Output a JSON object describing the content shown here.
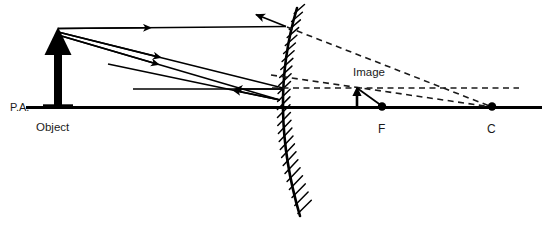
{
  "diagram": {
    "type": "optics-ray-diagram",
    "mirror_type": "convex",
    "canvas": {
      "width": 542,
      "height": 227
    },
    "colors": {
      "stroke": "#000000",
      "label": "#1a1a1a",
      "background": "#ffffff",
      "dashed": "#1a1a1a"
    },
    "labels": {
      "principal_axis": "P.A.",
      "object": "Object",
      "image": "Image",
      "focal_point": "F",
      "center_of_curvature": "C"
    },
    "label_positions": {
      "principal_axis": {
        "x": 10,
        "y": 111
      },
      "object": {
        "x": 36,
        "y": 131
      },
      "image": {
        "x": 353,
        "y": 76
      },
      "focal_point": {
        "x": 378,
        "y": 133
      },
      "center_of_curvature": {
        "x": 487,
        "y": 133
      }
    },
    "geometry": {
      "principal_axis": {
        "x1": 26,
        "y1": 107,
        "x2": 542,
        "y2": 107
      },
      "object_arrow": {
        "x": 58,
        "y_base": 107,
        "y_tip": 30,
        "height": 77
      },
      "image_arrow": {
        "x": 357,
        "y_base": 107,
        "y_tip": 88,
        "height": 19
      },
      "mirror_vertex": {
        "x": 281,
        "y": 107
      },
      "focal_point_dot": {
        "x": 382,
        "y": 107
      },
      "center_dot": {
        "x": 492,
        "y": 107
      },
      "mirror_curve": "M 297 8 Q 268 105 300 216"
    },
    "rays": {
      "incident": [
        {
          "name": "parallel-ray",
          "from_x": 58,
          "from_y": 30,
          "to_x": 286,
          "to_y": 27,
          "style": "solid"
        },
        {
          "name": "ray-to-focus",
          "from_x": 58,
          "from_y": 33,
          "to_x": 283,
          "to_y": 88,
          "style": "solid"
        },
        {
          "name": "ray-to-center",
          "from_x": 58,
          "from_y": 36,
          "to_x": 280,
          "to_y": 100,
          "style": "solid"
        }
      ],
      "reflected": [
        {
          "name": "reflected-parallel-ray",
          "from_x": 286,
          "from_y": 27,
          "to_x": 252,
          "to_y": 12,
          "style": "solid"
        },
        {
          "name": "reflected-horizontal-ray",
          "from_x": 283,
          "from_y": 89,
          "to_x": 133,
          "to_y": 89,
          "style": "solid"
        },
        {
          "name": "reflected-oblique-ray",
          "from_x": 280,
          "from_y": 100,
          "to_x": 108,
          "to_y": 64,
          "style": "solid"
        }
      ],
      "virtual_extensions": [
        {
          "name": "extension-from-parallel-ray",
          "from_x": 286,
          "from_y": 27,
          "to_x": 492,
          "to_y": 107,
          "style": "dashed"
        },
        {
          "name": "extension-horizontal-to-image",
          "from_x": 272,
          "from_y": 88,
          "to_x": 519,
          "to_y": 88,
          "style": "dashed"
        },
        {
          "name": "extension-through-image",
          "from_x": 272,
          "from_y": 76,
          "to_x": 492,
          "to_y": 107,
          "style": "dashed"
        },
        {
          "name": "extension-focus-line",
          "from_x": 357,
          "from_y": 88,
          "to_x": 382,
          "to_y": 107,
          "style": "solid"
        }
      ]
    },
    "annotations": {
      "mirror_back_hatching": true,
      "hatch_count": 26,
      "arrowheads_on_rays": true
    }
  }
}
